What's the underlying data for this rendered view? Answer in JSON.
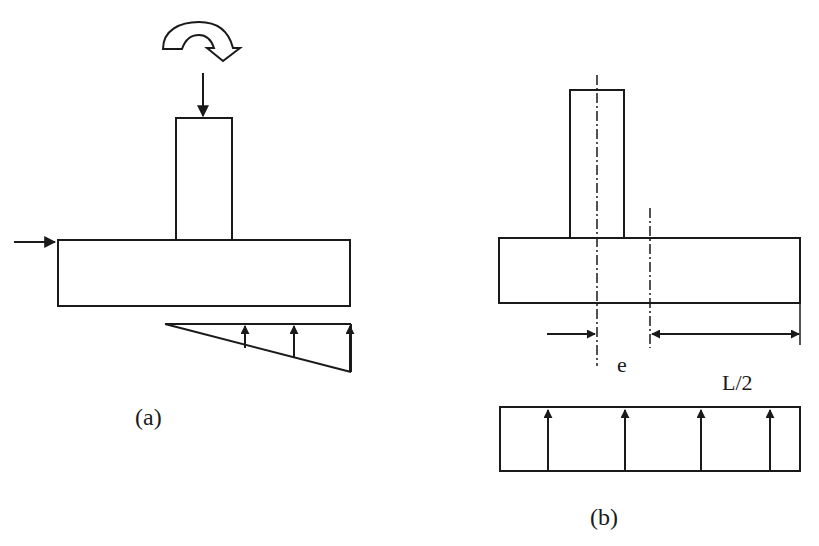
{
  "figure": {
    "panel_a": {
      "caption": "(a)",
      "elements": {
        "moment": "curved-moment-arrow (clockwise)",
        "vertical_load": "downward-load-arrow",
        "horizontal_load": "horizontal-load-arrow",
        "column": "column",
        "footing": "footing",
        "pressure_distribution": "triangular-soil-pressure",
        "pressure_arrow_count": 3
      }
    },
    "panel_b": {
      "caption": "(b)",
      "eccentricity_label": "e",
      "half_length_label": "L/2",
      "elements": {
        "column": "eccentric column",
        "footing": "footing",
        "column_centerline": "dash-dot centerline",
        "footing_centerline": "dash-dot centerline",
        "pressure_distribution": "uniform-soil-pressure",
        "pressure_arrow_count": 4
      }
    },
    "colors": {
      "stroke": "#1a1a1a",
      "background": "#ffffff"
    }
  }
}
